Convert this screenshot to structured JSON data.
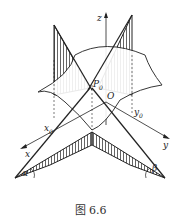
{
  "figure": {
    "caption": "图 6.6",
    "labels": {
      "z": "z",
      "p0": "P",
      "p0_sub": "0",
      "origin": "O",
      "x0": "x",
      "x0_sub": "0",
      "y0": "y",
      "y0_sub": "0",
      "x": "x",
      "y": "y",
      "alpha": "α",
      "beta": "β"
    },
    "colors": {
      "ink": "#222222",
      "background": "#ffffff"
    }
  }
}
